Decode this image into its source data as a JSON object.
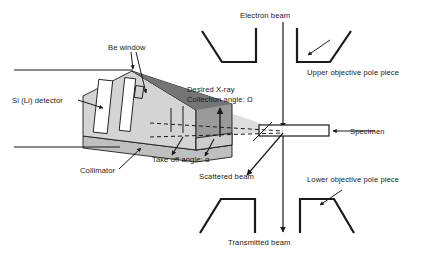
{
  "figure": {
    "type": "technical-diagram",
    "background_color": "#ffffff",
    "line_color": "#1a1a1a"
  },
  "labels": {
    "be_window": "Be window",
    "si_li_detector": "Si (Li) detector",
    "collimator": "Collimator",
    "desired_xray_line1": "Desired X-ray",
    "desired_xray_line2": "Collection angle: Ω",
    "take_off_angle": "Take off angle: α",
    "electron_beam": "Electron beam",
    "upper_objective_pole_piece": "Upper objective pole piece",
    "lower_objective_pole_piece": "Lower objective pole piece",
    "specimen": "Specimen",
    "scattered_beam": "Scattered beam",
    "transmitted_beam": "Transmitted beam"
  },
  "symbols": {
    "collection_angle": "Ω",
    "take_off_angle": "α"
  },
  "colors": {
    "stroke": "#1a1a1a",
    "detector_body_fill": "#d4d4d4",
    "detector_top_face_fill": "#8c8c8c",
    "detector_side_fill": "#c0c0c0",
    "collimator_fill": "#bfbfbf",
    "crystal_fill": "#ffffff",
    "cone_fill": "#d9d9d9",
    "text": "#1a1a1a"
  }
}
